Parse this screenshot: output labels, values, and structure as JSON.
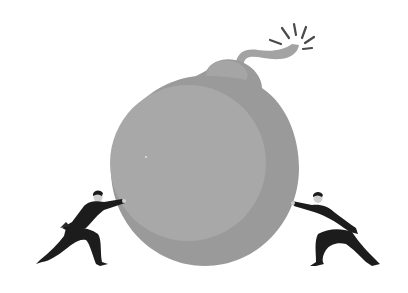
{
  "scene": {
    "description": "Two businessmen pushing against a giant bomb with a lit fuse from opposite sides",
    "colors": {
      "background": "#ffffff",
      "bomb_shadow": "#9a9a9a",
      "bomb_front": "#a7a7a7",
      "fuse": "#a3a3a3",
      "spark": "#4a4a4a",
      "figure": "#1c1c1c",
      "skin": "#cfcfcf"
    },
    "elements": [
      {
        "name": "bomb",
        "label": "Bomb"
      },
      {
        "name": "fuse",
        "label": "Lit fuse"
      },
      {
        "name": "left-businessman",
        "label": "Businessman pushing from left"
      },
      {
        "name": "right-businessman",
        "label": "Businessman pushing from right"
      }
    ]
  }
}
